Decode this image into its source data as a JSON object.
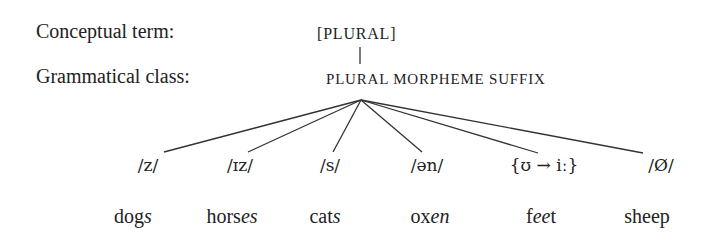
{
  "rows": {
    "conceptual_label": "Conceptual term:",
    "grammatical_label": "Grammatical class:"
  },
  "conceptual_term": "[PLURAL]",
  "grammatical_class": "PLURAL MORPHEME SUFFIX",
  "allomorphs": [
    {
      "phon": "/z/",
      "word_stem": "dog",
      "word_suffix": "s",
      "word_rest": ""
    },
    {
      "phon": "/ɪz/",
      "word_stem": "hors",
      "word_suffix": "es",
      "word_rest": ""
    },
    {
      "phon": "/s/",
      "word_stem": "cat",
      "word_suffix": "s",
      "word_rest": ""
    },
    {
      "phon": "/ən/",
      "word_stem": "ox",
      "word_suffix": "en",
      "word_rest": ""
    },
    {
      "phon": "{ʊ → iː}",
      "word_stem": "f",
      "word_suffix": "ee",
      "word_rest": "t"
    },
    {
      "phon": "/Ø/",
      "word_stem": "sheep",
      "word_suffix": "",
      "word_rest": ""
    }
  ],
  "colors": {
    "text": "#222222",
    "lines": "#333333",
    "background": "#ffffff"
  }
}
